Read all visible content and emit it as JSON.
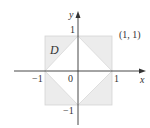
{
  "figure": {
    "region_label": "D",
    "x_axis_label": "x",
    "y_axis_label": "y",
    "origin_label": "0",
    "x_ticks": [
      "−1",
      "1"
    ],
    "y_ticks": [
      "1",
      "−1"
    ],
    "point_label": "(1, 1)",
    "colors": {
      "region_fill": "#ececec",
      "square_edge": "#d4d4d4",
      "diamond_fill": "#ffffff",
      "axis": "#333333"
    },
    "region": {
      "description": "square [-1,1]x[-1,1] minus diamond |x|+|y|<1",
      "square": [
        [
          -1,
          -1
        ],
        [
          1,
          -1
        ],
        [
          1,
          1
        ],
        [
          -1,
          1
        ]
      ],
      "diamond": [
        [
          1,
          0
        ],
        [
          0,
          1
        ],
        [
          -1,
          0
        ],
        [
          0,
          -1
        ]
      ]
    }
  }
}
